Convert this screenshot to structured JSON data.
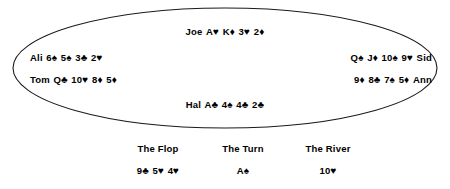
{
  "table": {
    "shape": "ellipse",
    "outline_color": "#1a1a1a",
    "fill_color": "#ffffff"
  },
  "players": [
    {
      "id": "joe",
      "name": "Joe",
      "name_side": "left",
      "position": "top",
      "cards": [
        {
          "rank": "A",
          "suit": "♥"
        },
        {
          "rank": "K",
          "suit": "♦"
        },
        {
          "rank": "3",
          "suit": "♥"
        },
        {
          "rank": "2",
          "suit": "♦"
        }
      ]
    },
    {
      "id": "ali",
      "name": "Ali",
      "name_side": "left",
      "position": "left-upper",
      "cards": [
        {
          "rank": "6",
          "suit": "♠"
        },
        {
          "rank": "5",
          "suit": "♠"
        },
        {
          "rank": "3",
          "suit": "♣"
        },
        {
          "rank": "2",
          "suit": "♥"
        }
      ]
    },
    {
      "id": "tom",
      "name": "Tom",
      "name_side": "left",
      "position": "left-lower",
      "cards": [
        {
          "rank": "Q",
          "suit": "♣"
        },
        {
          "rank": "10",
          "suit": "♥"
        },
        {
          "rank": "8",
          "suit": "♦"
        },
        {
          "rank": "5",
          "suit": "♦"
        }
      ]
    },
    {
      "id": "sid",
      "name": "Sid",
      "name_side": "right",
      "position": "right-upper",
      "cards": [
        {
          "rank": "Q",
          "suit": "♠"
        },
        {
          "rank": "J",
          "suit": "♦"
        },
        {
          "rank": "10",
          "suit": "♠"
        },
        {
          "rank": "9",
          "suit": "♥"
        }
      ]
    },
    {
      "id": "ann",
      "name": "Ann",
      "name_side": "right",
      "position": "right-lower",
      "cards": [
        {
          "rank": "9",
          "suit": "♦"
        },
        {
          "rank": "8",
          "suit": "♣"
        },
        {
          "rank": "7",
          "suit": "♠"
        },
        {
          "rank": "5",
          "suit": "♦"
        }
      ]
    },
    {
      "id": "hal",
      "name": "Hal",
      "name_side": "left",
      "position": "bottom",
      "cards": [
        {
          "rank": "A",
          "suit": "♣"
        },
        {
          "rank": "4",
          "suit": "♠"
        },
        {
          "rank": "4",
          "suit": "♣"
        },
        {
          "rank": "2",
          "suit": "♣"
        }
      ]
    }
  ],
  "community": [
    {
      "id": "flop",
      "label": "The Flop",
      "cards": [
        {
          "rank": "9",
          "suit": "♣"
        },
        {
          "rank": "5",
          "suit": "♥"
        },
        {
          "rank": "4",
          "suit": "♥"
        }
      ]
    },
    {
      "id": "turn",
      "label": "The Turn",
      "cards": [
        {
          "rank": "A",
          "suit": "♠"
        }
      ]
    },
    {
      "id": "river",
      "label": "The River",
      "cards": [
        {
          "rank": "10",
          "suit": "♥"
        }
      ]
    }
  ]
}
